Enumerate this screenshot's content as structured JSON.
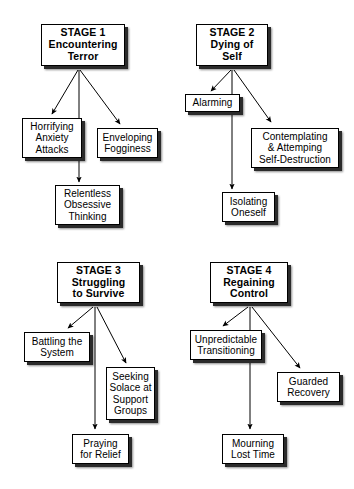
{
  "diagram": {
    "type": "flowchart",
    "title": "",
    "background_color": "#ffffff",
    "box_fill_color": "#ffffff",
    "box_border_color": "#000000",
    "shadow_color": "#2b2b2b",
    "arrow_color": "#000000",
    "clusters": [
      {
        "id": "stage-1",
        "header": {
          "stage_label": "STAGE 1",
          "stage_title": "Encountering\nTerror",
          "full_text": "STAGE 1\nEncountering\nTerror"
        },
        "children": [
          {
            "id": "horrifying-anxiety-attacks",
            "text": "Horrifying\nAnxiety\nAttacks"
          },
          {
            "id": "enveloping-fogginess",
            "text": "Enveloping\nFogginess"
          },
          {
            "id": "relentless-obsessive-thinking",
            "text": "Relentless\nObsessive\nThinking"
          }
        ]
      },
      {
        "id": "stage-2",
        "header": {
          "stage_label": "STAGE 2",
          "stage_title": "Dying of\nSelf",
          "full_text": "STAGE 2\nDying of\nSelf"
        },
        "children": [
          {
            "id": "alarming",
            "text": "Alarming"
          },
          {
            "id": "contemplating-attemping-self-destruction",
            "text": "Contemplating\n& Attemping\nSelf-Destruction"
          },
          {
            "id": "isolating-oneself",
            "text": "Isolating\nOneself"
          }
        ]
      },
      {
        "id": "stage-3",
        "header": {
          "stage_label": "STAGE 3",
          "stage_title": "Struggling\nto Survive",
          "full_text": "STAGE 3\nStruggling\nto Survive"
        },
        "children": [
          {
            "id": "battling-the-system",
            "text": "Battling the\nSystem"
          },
          {
            "id": "seeking-solace-at-support-groups",
            "text": "Seeking\nSolace at\nSupport\nGroups"
          },
          {
            "id": "praying-for-relief",
            "text": "Praying\nfor Relief"
          }
        ]
      },
      {
        "id": "stage-4",
        "header": {
          "stage_label": "STAGE 4",
          "stage_title": "Regaining\nControl",
          "full_text": "STAGE 4\nRegaining\nControl"
        },
        "children": [
          {
            "id": "unpredictable-transitioning",
            "text": "Unpredictable\nTransitioning"
          },
          {
            "id": "guarded-recovery",
            "text": "Guarded\nRecovery"
          },
          {
            "id": "mourning-lost-time",
            "text": "Mourning\nLost Time"
          }
        ]
      }
    ]
  }
}
